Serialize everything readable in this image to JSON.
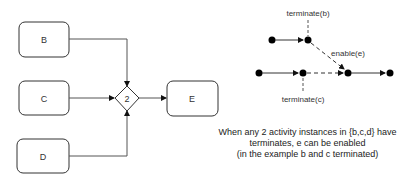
{
  "left_diagram": {
    "nodes": [
      {
        "id": "B",
        "label": "B"
      },
      {
        "id": "C",
        "label": "C"
      },
      {
        "id": "D",
        "label": "D"
      },
      {
        "id": "E",
        "label": "E"
      }
    ],
    "gateway": {
      "label": "2"
    }
  },
  "right_diagram": {
    "labels": {
      "terminate_b": "terminate(b)",
      "terminate_c": "terminate(c)",
      "enable_e": "enable(e)"
    }
  },
  "caption": {
    "line1": "When any 2 activity instances in {b,c,d} have",
    "line2": "terminates, e can be  enabled",
    "line3": "(in the example b and c terminated)"
  },
  "colors": {
    "stroke": "#333333",
    "fill": "#ffffff",
    "dot": "#000000"
  }
}
